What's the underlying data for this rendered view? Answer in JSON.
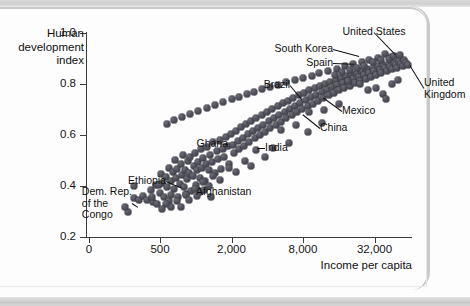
{
  "figure": {
    "y_axis_title": "Human development index",
    "x_axis_title": "Income per capita"
  },
  "chart_data": {
    "type": "scatter",
    "title": "",
    "xlabel": "Income per capita",
    "ylabel": "Human development index",
    "x_scale": "log",
    "y_scale": "linear",
    "xlim": [
      200,
      64000
    ],
    "ylim": [
      0.2,
      1.0
    ],
    "grid": false,
    "legend": null,
    "xticks": [
      {
        "value": 0,
        "label": "0"
      },
      {
        "value": 500,
        "label": "500"
      },
      {
        "value": 2000,
        "label": "2,000"
      },
      {
        "value": 8000,
        "label": "8,000"
      },
      {
        "value": 32000,
        "label": "32,000"
      }
    ],
    "yticks": [
      {
        "value": 1.0,
        "label": "1.0"
      },
      {
        "value": 0.8,
        "label": "0.8"
      },
      {
        "value": 0.6,
        "label": "0.6"
      },
      {
        "value": 0.4,
        "label": "0.4"
      },
      {
        "value": 0.2,
        "label": "0.2"
      }
    ],
    "annotations": [
      {
        "text": "United States",
        "anchor": "c",
        "tx": 374,
        "ty": 32,
        "px": 398,
        "py": 57
      },
      {
        "text": "South Korea",
        "anchor": "r",
        "tx": 333,
        "ty": 49,
        "px": 363,
        "py": 57
      },
      {
        "text": "Spain",
        "anchor": "r",
        "tx": 333,
        "ty": 63,
        "px": 358,
        "py": 64
      },
      {
        "text": "United Kingdom",
        "anchor": "l",
        "tx": 424,
        "ty": 88,
        "px": 408,
        "py": 62
      },
      {
        "text": "Brazil",
        "anchor": "r",
        "tx": 290,
        "ty": 85,
        "px": 305,
        "py": 103
      },
      {
        "text": "Mexico",
        "anchor": "l",
        "tx": 342,
        "ty": 111,
        "px": 320,
        "py": 95
      },
      {
        "text": "China",
        "anchor": "l",
        "tx": 320,
        "ty": 128,
        "px": 300,
        "py": 112
      },
      {
        "text": "India",
        "anchor": "l",
        "tx": 265,
        "ty": 148,
        "px": 253,
        "py": 148
      },
      {
        "text": "Ghana",
        "anchor": "r",
        "tx": 228,
        "ty": 144,
        "px": 213,
        "py": 143
      },
      {
        "text": "Ethiopia",
        "anchor": "r",
        "tx": 166,
        "ty": 181,
        "px": 185,
        "py": 189
      },
      {
        "text": "Afghanistan",
        "anchor": "l",
        "tx": 196,
        "ty": 192,
        "px": 190,
        "py": 192
      },
      {
        "text": "Dem. Rep. of the Congo",
        "anchor": "r",
        "tx": 132,
        "ty": 203,
        "px": 141,
        "py": 209
      }
    ],
    "points": [
      [
        270,
        0.299
      ],
      [
        300,
        0.352
      ],
      [
        330,
        0.345
      ],
      [
        360,
        0.362
      ],
      [
        255,
        0.318
      ],
      [
        390,
        0.345
      ],
      [
        300,
        0.399
      ],
      [
        420,
        0.383
      ],
      [
        460,
        0.402
      ],
      [
        440,
        0.336
      ],
      [
        500,
        0.372
      ],
      [
        520,
        0.412
      ],
      [
        505,
        0.446
      ],
      [
        540,
        0.358
      ],
      [
        560,
        0.436
      ],
      [
        575,
        0.395
      ],
      [
        590,
        0.472
      ],
      [
        600,
        0.341
      ],
      [
        615,
        0.418
      ],
      [
        640,
        0.456
      ],
      [
        650,
        0.388
      ],
      [
        665,
        0.503
      ],
      [
        680,
        0.43
      ],
      [
        700,
        0.466
      ],
      [
        715,
        0.357
      ],
      [
        730,
        0.408
      ],
      [
        745,
        0.487
      ],
      [
        760,
        0.443
      ],
      [
        780,
        0.523
      ],
      [
        800,
        0.398
      ],
      [
        810,
        0.462
      ],
      [
        830,
        0.37
      ],
      [
        850,
        0.427
      ],
      [
        865,
        0.498
      ],
      [
        880,
        0.452
      ],
      [
        900,
        0.515
      ],
      [
        920,
        0.382
      ],
      [
        940,
        0.441
      ],
      [
        960,
        0.478
      ],
      [
        985,
        0.53
      ],
      [
        1000,
        0.405
      ],
      [
        1020,
        0.463
      ],
      [
        1050,
        0.496
      ],
      [
        1080,
        0.43
      ],
      [
        1100,
        0.545
      ],
      [
        1130,
        0.472
      ],
      [
        1160,
        0.508
      ],
      [
        1190,
        0.418
      ],
      [
        1220,
        0.487
      ],
      [
        1250,
        0.553
      ],
      [
        1290,
        0.461
      ],
      [
        1330,
        0.522
      ],
      [
        1370,
        0.495
      ],
      [
        1410,
        0.571
      ],
      [
        1450,
        0.45
      ],
      [
        1500,
        0.538
      ],
      [
        1540,
        0.505
      ],
      [
        1590,
        0.58
      ],
      [
        1640,
        0.468
      ],
      [
        1690,
        0.546
      ],
      [
        1740,
        0.515
      ],
      [
        1800,
        0.592
      ],
      [
        1860,
        0.556
      ],
      [
        1920,
        0.486
      ],
      [
        1980,
        0.604
      ],
      [
        2040,
        0.562
      ],
      [
        2110,
        0.53
      ],
      [
        2180,
        0.617
      ],
      [
        2250,
        0.575
      ],
      [
        2320,
        0.545
      ],
      [
        2400,
        0.63
      ],
      [
        2480,
        0.59
      ],
      [
        2560,
        0.558
      ],
      [
        2650,
        0.643
      ],
      [
        2740,
        0.603
      ],
      [
        2830,
        0.572
      ],
      [
        2930,
        0.656
      ],
      [
        3030,
        0.616
      ],
      [
        3130,
        0.588
      ],
      [
        3240,
        0.668
      ],
      [
        3350,
        0.629
      ],
      [
        3470,
        0.601
      ],
      [
        3590,
        0.68
      ],
      [
        3710,
        0.641
      ],
      [
        3840,
        0.613
      ],
      [
        3980,
        0.692
      ],
      [
        4110,
        0.655
      ],
      [
        4260,
        0.627
      ],
      [
        4400,
        0.703
      ],
      [
        4560,
        0.667
      ],
      [
        4720,
        0.64
      ],
      [
        4880,
        0.714
      ],
      [
        5050,
        0.679
      ],
      [
        5230,
        0.652
      ],
      [
        5410,
        0.725
      ],
      [
        5600,
        0.691
      ],
      [
        5790,
        0.665
      ],
      [
        5990,
        0.735
      ],
      [
        6200,
        0.703
      ],
      [
        6420,
        0.677
      ],
      [
        6640,
        0.746
      ],
      [
        6870,
        0.714
      ],
      [
        7110,
        0.69
      ],
      [
        7360,
        0.756
      ],
      [
        7610,
        0.726
      ],
      [
        7880,
        0.701
      ],
      [
        8150,
        0.766
      ],
      [
        8440,
        0.737
      ],
      [
        8730,
        0.712
      ],
      [
        9030,
        0.775
      ],
      [
        9350,
        0.748
      ],
      [
        9670,
        0.723
      ],
      [
        10000,
        0.784
      ],
      [
        10350,
        0.758
      ],
      [
        10710,
        0.734
      ],
      [
        11080,
        0.793
      ],
      [
        11470,
        0.768
      ],
      [
        11870,
        0.744
      ],
      [
        12280,
        0.801
      ],
      [
        12700,
        0.778
      ],
      [
        13140,
        0.755
      ],
      [
        13600,
        0.809
      ],
      [
        14070,
        0.787
      ],
      [
        14560,
        0.765
      ],
      [
        15070,
        0.817
      ],
      [
        15590,
        0.796
      ],
      [
        16130,
        0.775
      ],
      [
        16690,
        0.824
      ],
      [
        17270,
        0.805
      ],
      [
        17870,
        0.785
      ],
      [
        18490,
        0.831
      ],
      [
        19130,
        0.813
      ],
      [
        19800,
        0.794
      ],
      [
        20480,
        0.838
      ],
      [
        21190,
        0.821
      ],
      [
        21930,
        0.803
      ],
      [
        22690,
        0.845
      ],
      [
        23480,
        0.829
      ],
      [
        24290,
        0.812
      ],
      [
        25140,
        0.851
      ],
      [
        26010,
        0.836
      ],
      [
        26910,
        0.82
      ],
      [
        27850,
        0.857
      ],
      [
        28820,
        0.843
      ],
      [
        29820,
        0.828
      ],
      [
        30860,
        0.863
      ],
      [
        31930,
        0.85
      ],
      [
        33040,
        0.836
      ],
      [
        34190,
        0.869
      ],
      [
        35380,
        0.856
      ],
      [
        36610,
        0.843
      ],
      [
        37890,
        0.874
      ],
      [
        39210,
        0.862
      ],
      [
        40570,
        0.85
      ],
      [
        41990,
        0.879
      ],
      [
        43450,
        0.868
      ],
      [
        44970,
        0.857
      ],
      [
        46530,
        0.884
      ],
      [
        48150,
        0.874
      ],
      [
        49820,
        0.863
      ],
      [
        51550,
        0.889
      ],
      [
        53340,
        0.879
      ],
      [
        55190,
        0.869
      ],
      [
        57110,
        0.893
      ],
      [
        59090,
        0.884
      ],
      [
        61140,
        0.875
      ],
      [
        44000,
        0.906
      ],
      [
        39000,
        0.918
      ],
      [
        34000,
        0.902
      ],
      [
        29000,
        0.893
      ],
      [
        25000,
        0.886
      ],
      [
        21000,
        0.878
      ],
      [
        18000,
        0.869
      ],
      [
        15500,
        0.86
      ],
      [
        13000,
        0.851
      ],
      [
        11000,
        0.842
      ],
      [
        9500,
        0.833
      ],
      [
        8000,
        0.824
      ],
      [
        6800,
        0.815
      ],
      [
        5800,
        0.806
      ],
      [
        4900,
        0.797
      ],
      [
        4200,
        0.788
      ],
      [
        3600,
        0.779
      ],
      [
        3100,
        0.77
      ],
      [
        2700,
        0.76
      ],
      [
        2300,
        0.75
      ],
      [
        2000,
        0.74
      ],
      [
        1700,
        0.729
      ],
      [
        1450,
        0.718
      ],
      [
        1250,
        0.707
      ],
      [
        1050,
        0.695
      ],
      [
        900,
        0.683
      ],
      [
        770,
        0.67
      ],
      [
        660,
        0.657
      ],
      [
        570,
        0.645
      ],
      [
        9000,
        0.69
      ],
      [
        7000,
        0.64
      ],
      [
        5200,
        0.62
      ],
      [
        12000,
        0.7
      ],
      [
        16000,
        0.72
      ],
      [
        3200,
        0.54
      ],
      [
        2600,
        0.5
      ],
      [
        1900,
        0.47
      ],
      [
        1400,
        0.44
      ],
      [
        1150,
        0.415
      ],
      [
        980,
        0.39
      ],
      [
        830,
        0.365
      ],
      [
        700,
        0.34
      ],
      [
        620,
        0.318
      ],
      [
        560,
        0.33
      ],
      [
        31000,
        0.885
      ],
      [
        36000,
        0.895
      ],
      [
        42000,
        0.9
      ],
      [
        47000,
        0.908
      ],
      [
        52000,
        0.912
      ],
      [
        26000,
        0.87
      ],
      [
        23000,
        0.862
      ],
      [
        20000,
        0.855
      ],
      [
        17000,
        0.847
      ],
      [
        38000,
        0.76
      ],
      [
        33000,
        0.785
      ],
      [
        45000,
        0.8
      ],
      [
        50000,
        0.815
      ],
      [
        40000,
        0.74
      ],
      [
        28000,
        0.775
      ],
      [
        24000,
        0.8
      ],
      [
        19000,
        0.812
      ],
      [
        15000,
        0.836
      ],
      [
        8800,
        0.61
      ],
      [
        11500,
        0.648
      ],
      [
        6100,
        0.568
      ],
      [
        4500,
        0.548
      ],
      [
        3800,
        0.512
      ],
      [
        2900,
        0.478
      ],
      [
        2200,
        0.455
      ],
      [
        1600,
        0.425
      ],
      [
        1300,
        0.4
      ],
      [
        1080,
        0.378
      ],
      [
        520,
        0.308
      ],
      [
        470,
        0.33
      ],
      [
        620,
        0.365
      ],
      [
        750,
        0.318
      ],
      [
        880,
        0.345
      ],
      [
        1020,
        0.36
      ],
      [
        1180,
        0.385
      ],
      [
        1350,
        0.355
      ],
      [
        490,
        0.402
      ],
      [
        430,
        0.358
      ]
    ]
  }
}
